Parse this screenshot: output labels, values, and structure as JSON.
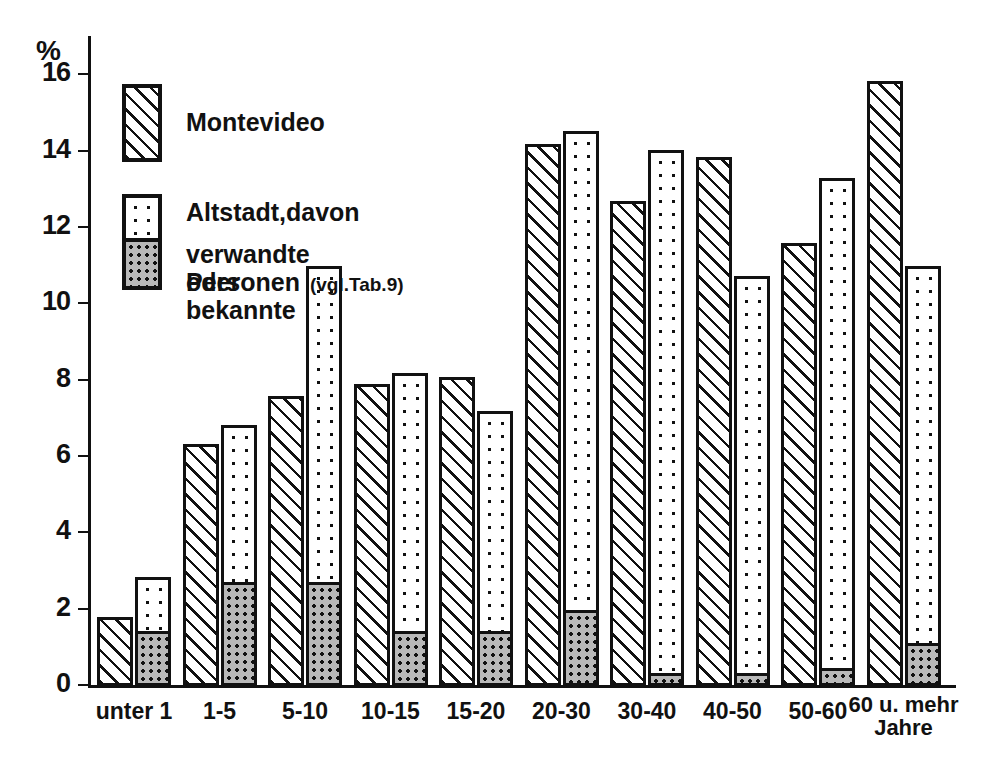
{
  "chart_data": {
    "type": "bar",
    "title": "",
    "xlabel": "",
    "ylabel": "%",
    "ylim": [
      0,
      17
    ],
    "yticks": [
      0,
      2,
      4,
      6,
      8,
      10,
      12,
      14,
      16
    ],
    "ytick_labels": [
      "0",
      "2",
      "4",
      "6",
      "8",
      "10",
      "12",
      "14",
      "16"
    ],
    "grid": false,
    "legend_position": "upper-left",
    "categories": [
      "unter 1",
      "1-5",
      "5-10",
      "10-15",
      "15-20",
      "20-30",
      "30-40",
      "40-50",
      "50-60",
      "60 u. mehr\nJahre"
    ],
    "category_unit_note": "Jahre",
    "series": [
      {
        "name": "Montevideo",
        "pattern": "diagonal-hatch",
        "values": [
          1.8,
          6.35,
          7.6,
          7.9,
          8.1,
          14.2,
          12.7,
          13.85,
          11.6,
          15.85
        ]
      },
      {
        "name": "Altstadt,davon",
        "pattern": "light-dots",
        "values": [
          2.85,
          6.85,
          11.0,
          8.2,
          7.2,
          14.55,
          14.05,
          10.75,
          13.3,
          11.0
        ]
      },
      {
        "name": "verwandte oder bekannte Personen (vgl.Tab.9)",
        "pattern": "dense-dark-dots",
        "note": "Teilmenge der Altstadt-Saeule (von unten)",
        "values": [
          1.35,
          2.65,
          2.65,
          1.35,
          1.35,
          1.9,
          0.25,
          0.25,
          0.4,
          1.05
        ]
      }
    ]
  },
  "legend": {
    "items": [
      {
        "label": "Montevideo",
        "sub": ""
      },
      {
        "label": "Altstadt,davon",
        "sub": ""
      },
      {
        "label": "verwandte oder bekannte",
        "line2": "Personen",
        "note": "(vgl.Tab.9)"
      }
    ]
  },
  "axis": {
    "y_unit": "%"
  },
  "colors": {
    "ink": "#111111",
    "paper": "#ffffff",
    "dark_fill": "#b9b9b9"
  }
}
